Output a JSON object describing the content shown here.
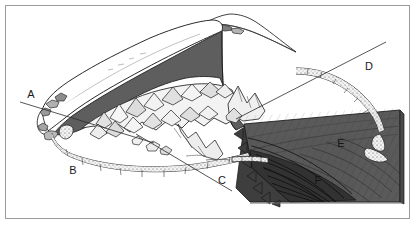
{
  "figure": {
    "kind": "geological-block-diagram",
    "frame": {
      "border_color": "#9a9a9a",
      "background_color": "#ffffff"
    },
    "colors": {
      "ink": "#1a1a1a",
      "outline": "#2b2b2b",
      "dark_gray_fill": "#5e5e5e",
      "mid_gray_fill": "#6f6f6f",
      "light_gray_fill": "#bdbdbd",
      "pale_fill": "#e4e4e4",
      "white_fill": "#ffffff",
      "block_dark": "#4a4a4a",
      "block_darker": "#3a3a3a",
      "hatch_stroke": "#262626",
      "frame_border": "#9a9a9a"
    },
    "labels": [
      {
        "id": "label-a",
        "text": "A",
        "x": 31,
        "y": 98,
        "feature": "upper ice/snow tongue margin"
      },
      {
        "id": "label-b",
        "text": "B",
        "x": 73,
        "y": 174,
        "feature": "outer terminal moraine ridge"
      },
      {
        "id": "label-c",
        "text": "C",
        "x": 222,
        "y": 184,
        "feature": "inner moraine ridge segment"
      },
      {
        "id": "label-d",
        "text": "D",
        "x": 369,
        "y": 70,
        "feature": "lateral moraine arc"
      },
      {
        "id": "label-e",
        "text": "E",
        "x": 341,
        "y": 147,
        "feature": "upper bedrock block face"
      },
      {
        "id": "label-f",
        "text": "F",
        "x": 318,
        "y": 184,
        "feature": "foliated/striated lower bedrock"
      }
    ],
    "section_lines": [
      {
        "id": "section-line-left",
        "x1": 20,
        "y1": 102,
        "x2": 152,
        "y2": 142,
        "note": "straight cross-section trace through A"
      },
      {
        "id": "section-line-center",
        "x1": 136,
        "y1": 135,
        "x2": 232,
        "y2": 190,
        "note": "straight cross-section trace toward C"
      },
      {
        "id": "section-line-right",
        "x1": 236,
        "y1": 118,
        "x2": 384,
        "y2": 43,
        "note": "straight cross-section trace through D arc"
      }
    ]
  }
}
